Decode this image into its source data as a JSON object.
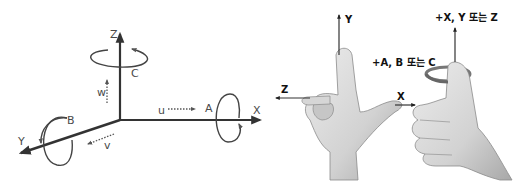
{
  "diagram": {
    "title": "",
    "left_panel": {
      "description": "Machine coordinate axes with linear and rotary axes",
      "axes": [
        {
          "name": "X",
          "label": "X",
          "linear_label": "u",
          "rotary_label": "A"
        },
        {
          "name": "Y",
          "label": "Y",
          "linear_label": "v",
          "rotary_label": "B"
        },
        {
          "name": "Z",
          "label": "Z",
          "linear_label": "w",
          "rotary_label": "C"
        }
      ],
      "labels": {
        "x_axis": "X",
        "y_axis": "Y",
        "z_axis": "Z",
        "rot_x": "A",
        "rot_y": "B",
        "rot_z": "C",
        "lin_x": "u",
        "lin_y": "v",
        "lin_z": "w"
      }
    },
    "right_panel": {
      "description": "Right-hand rule illustrations",
      "hand_axes": {
        "y": "Y",
        "z": "Z",
        "x": "X"
      },
      "thumb_rule": {
        "linear_label": "+X, Y 또는 Z",
        "rotary_label": "+A, B 또는 C"
      }
    },
    "colors": {
      "axis_line": "#333333",
      "text": "#222222",
      "hand_fill": "#d9d9d9",
      "hand_shadow": "#9a9a9a",
      "background": "#ffffff"
    }
  }
}
